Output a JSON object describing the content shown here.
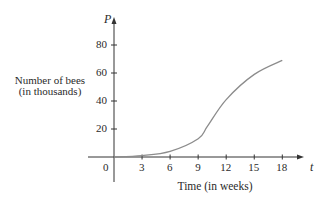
{
  "chart_data": {
    "type": "line",
    "title": "",
    "xlabel": "Time (in weeks)",
    "ylabel": "Number of bees (in thousands)",
    "ylabel_lines": [
      "Number of bees",
      "(in thousands)"
    ],
    "x_axis_symbol": "t",
    "y_axis_symbol": "P",
    "origin_label": "0",
    "x_ticks": [
      3,
      6,
      9,
      12,
      15,
      18
    ],
    "y_ticks": [
      20,
      40,
      60,
      80
    ],
    "xlim": [
      0,
      18
    ],
    "ylim": [
      0,
      80
    ],
    "grid": false,
    "legend": null,
    "series": [
      {
        "name": "Bee population",
        "x": [
          0,
          3,
          6,
          9,
          10,
          12,
          15,
          18
        ],
        "values": [
          0,
          1,
          4,
          13,
          22,
          41,
          59,
          69
        ]
      }
    ],
    "colors": {
      "axis": "#333333",
      "curve": "#8c8c8c",
      "text": "#2a2a2a"
    }
  }
}
